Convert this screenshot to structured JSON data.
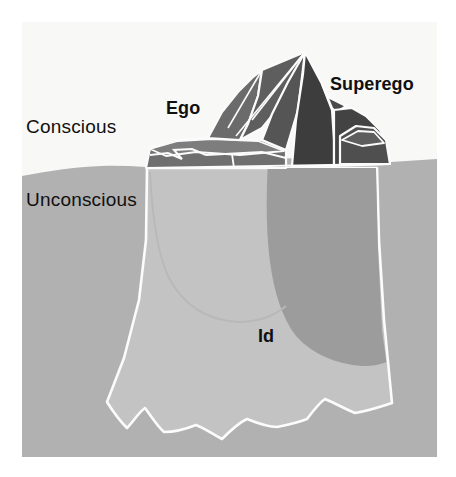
{
  "diagram": {
    "type": "iceberg-diagram",
    "canvas": {
      "width": 456,
      "height": 477
    }
  },
  "labels": {
    "conscious": "Conscious",
    "unconscious": "Unconscious",
    "ego": "Ego",
    "superego": "Superego",
    "id": "Id"
  },
  "regions": [
    {
      "name": "sky",
      "label": "Conscious",
      "description": "White area above the waterline"
    },
    {
      "name": "water",
      "label": "Unconscious",
      "description": "Medium grey area below the waterline"
    },
    {
      "name": "iceberg-tip",
      "label": "Ego and Superego",
      "description": "Dark grey peaks above the waterline"
    },
    {
      "name": "iceberg-submerged",
      "label": "Id",
      "description": "Large light grey mass below the waterline"
    }
  ],
  "colors": {
    "page_background": "#ffffff",
    "sky": "#f7f7f6",
    "water": "#b0b0b0",
    "iceberg_submerged_light": "#c2c2c2",
    "iceberg_submerged_dark": "#9a9a9a",
    "iceberg_tip_mid": "#6f6f6f",
    "iceberg_tip_dark": "#4a4a4a",
    "iceberg_tip_darkest": "#3a3a3a",
    "iceberg_tip_light": "#848484",
    "outline": "#fdfdfd",
    "text": "#101010"
  },
  "geometry": {
    "waterline_y_left": 170,
    "waterline_y_right": 164,
    "content_left": 22,
    "content_right": 437,
    "content_bottom": 457,
    "iceberg_peak": {
      "x": 305,
      "y": 52
    }
  }
}
